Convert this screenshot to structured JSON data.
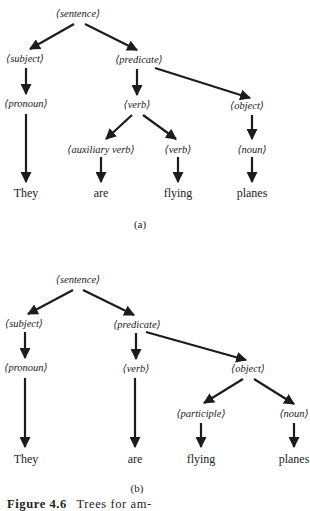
{
  "tree_a": {
    "label": "(a)",
    "nodes": {
      "sentence": "⟨sentence⟩",
      "subject": "⟨subject⟩",
      "predicate": "⟨predicate⟩",
      "pronoun": "⟨pronoun⟩",
      "verb": "⟨verb⟩",
      "object": "⟨object⟩",
      "auxiliary_verb": "⟨auxiliary verb⟩",
      "verb2": "⟨verb⟩",
      "noun": "⟨noun⟩"
    },
    "terminals": {
      "they": "They",
      "are": "are",
      "flying": "flying",
      "planes": "planes"
    }
  },
  "tree_b": {
    "label": "(b)",
    "nodes": {
      "sentence": "⟨sentence⟩",
      "subject": "⟨subject⟩",
      "predicate": "⟨predicate⟩",
      "pronoun": "⟨pronoun⟩",
      "verb": "⟨verb⟩",
      "object": "⟨object⟩",
      "participle": "⟨participle⟩",
      "noun": "⟨noun⟩"
    },
    "terminals": {
      "they": "They",
      "are": "are",
      "flying": "flying",
      "planes": "planes"
    }
  },
  "caption": {
    "figure_label": "Figure 4.6",
    "text": "Trees for am-"
  }
}
